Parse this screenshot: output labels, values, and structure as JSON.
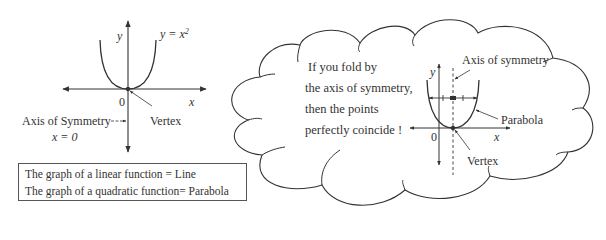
{
  "left_graph": {
    "function_label": "y = x²",
    "y_axis_label": "y",
    "x_axis_label": "x",
    "origin_label": "0",
    "vertex_label": "Vertex",
    "axis_of_symmetry_label": "Axis of Symmetry",
    "axis_of_symmetry_equation": "x = 0"
  },
  "info_box": {
    "lines": [
      "The graph of a linear function =  Line",
      "The graph of a quadratic function= Parabola"
    ]
  },
  "cloud": {
    "text_lines": [
      "If you fold by",
      "the axis of symmetry,",
      "then the points",
      "perfectly coincide !"
    ],
    "graph": {
      "axis_of_symmetry_label": "Axis of symmetry",
      "parabola_label": "Parabola",
      "vertex_label": "Vertex",
      "y_axis_label": "y",
      "x_axis_label": "x",
      "origin_label": "0"
    }
  },
  "colors": {
    "stroke": "#333333",
    "background": "#ffffff"
  }
}
